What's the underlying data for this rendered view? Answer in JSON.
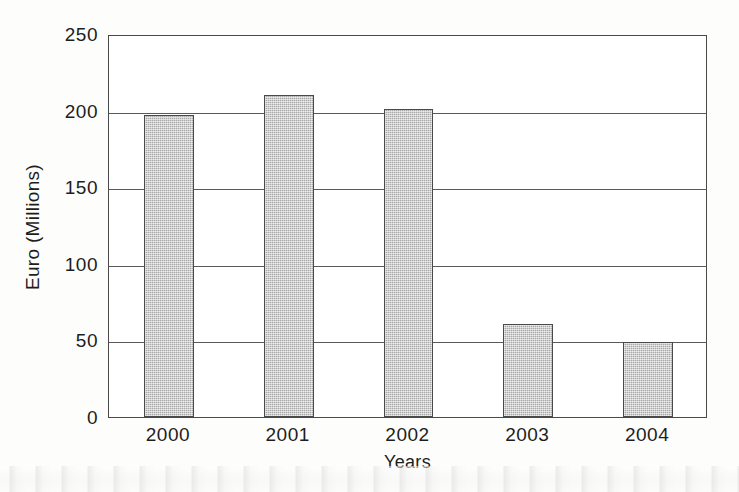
{
  "chart_data": {
    "type": "bar",
    "title": "",
    "xlabel": "Years",
    "ylabel": "Euro (Millions)",
    "categories": [
      "2000",
      "2001",
      "2002",
      "2003",
      "2004"
    ],
    "values": [
      197,
      210,
      201,
      61,
      49
    ],
    "ylim": [
      0,
      250
    ],
    "yticks": [
      0,
      50,
      100,
      150,
      200,
      250
    ],
    "ytick_labels": [
      "0",
      "50",
      "100",
      "150",
      "200",
      "250"
    ],
    "grid": "horizontal",
    "legend": null,
    "series": [
      {
        "name": "Euro (Millions)",
        "values": [
          197,
          210,
          201,
          61,
          49
        ]
      }
    ],
    "colors": {
      "bar_fill": "#a9a9a9",
      "bar_edge": "#4a4a4a",
      "gridline": "#5a5a5a",
      "axis": "#4a4a4a",
      "text": "#1d1d1d",
      "background": "#fdfdfc"
    }
  }
}
